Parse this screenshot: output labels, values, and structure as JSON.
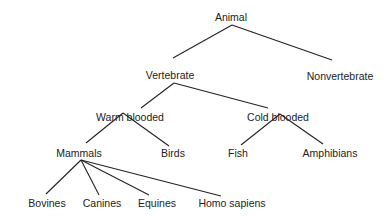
{
  "diagram": {
    "type": "tree",
    "line_color": "#222222",
    "nodes": [
      {
        "id": "animal",
        "label": "Animal",
        "x": 231,
        "y": 17
      },
      {
        "id": "vertebrate",
        "label": "Vertebrate",
        "x": 170,
        "y": 75
      },
      {
        "id": "nonvertebrate",
        "label": "Nonvertebrate",
        "x": 340,
        "y": 76
      },
      {
        "id": "warm",
        "label": "Warm blooded",
        "x": 130,
        "y": 117
      },
      {
        "id": "cold",
        "label": "Cold blooded",
        "x": 278,
        "y": 117
      },
      {
        "id": "mammals",
        "label": "Mammals",
        "x": 79,
        "y": 153
      },
      {
        "id": "birds",
        "label": "Birds",
        "x": 173,
        "y": 153
      },
      {
        "id": "fish",
        "label": "Fish",
        "x": 238,
        "y": 153
      },
      {
        "id": "amphibians",
        "label": "Amphibians",
        "x": 330,
        "y": 153
      },
      {
        "id": "bovines",
        "label": "Bovines",
        "x": 47,
        "y": 203
      },
      {
        "id": "canines",
        "label": "Canines",
        "x": 102,
        "y": 203
      },
      {
        "id": "equines",
        "label": "Equines",
        "x": 157,
        "y": 203
      },
      {
        "id": "homo",
        "label": "Homo sapiens",
        "x": 232,
        "y": 203
      }
    ],
    "edges": [
      {
        "from": "animal",
        "to": "vertebrate",
        "x1": 232,
        "y1": 25,
        "x2": 173,
        "y2": 58
      },
      {
        "from": "animal",
        "to": "nonvertebrate",
        "x1": 232,
        "y1": 25,
        "x2": 332,
        "y2": 60
      },
      {
        "from": "vertebrate",
        "to": "warm",
        "x1": 174,
        "y1": 83,
        "x2": 141,
        "y2": 108
      },
      {
        "from": "vertebrate",
        "to": "cold",
        "x1": 174,
        "y1": 83,
        "x2": 268,
        "y2": 108
      },
      {
        "from": "warm",
        "to": "mammals",
        "x1": 123,
        "y1": 113,
        "x2": 86,
        "y2": 143
      },
      {
        "from": "warm",
        "to": "birds",
        "x1": 123,
        "y1": 113,
        "x2": 169,
        "y2": 146
      },
      {
        "from": "cold",
        "to": "fish",
        "x1": 280,
        "y1": 114,
        "x2": 241,
        "y2": 145
      },
      {
        "from": "cold",
        "to": "amphibians",
        "x1": 280,
        "y1": 114,
        "x2": 323,
        "y2": 144
      },
      {
        "from": "mammals",
        "to": "bovines",
        "x1": 81,
        "y1": 160,
        "x2": 46,
        "y2": 194
      },
      {
        "from": "mammals",
        "to": "canines",
        "x1": 81,
        "y1": 160,
        "x2": 99,
        "y2": 195
      },
      {
        "from": "mammals",
        "to": "equines",
        "x1": 81,
        "y1": 160,
        "x2": 149,
        "y2": 195
      },
      {
        "from": "mammals",
        "to": "homo",
        "x1": 81,
        "y1": 160,
        "x2": 221,
        "y2": 196
      }
    ]
  }
}
